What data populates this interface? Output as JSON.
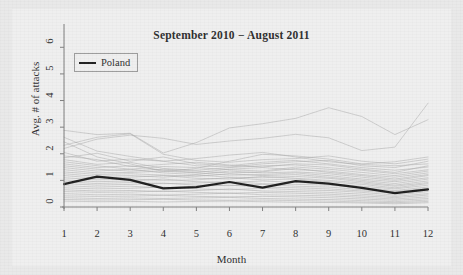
{
  "chart_data": {
    "type": "line",
    "title": "September 2010 − August 2011",
    "xlabel": "Month",
    "ylabel": "Avg. # of attacks",
    "xlim": [
      1,
      12
    ],
    "ylim": [
      0,
      6.5
    ],
    "xticks": [
      "1",
      "2",
      "3",
      "4",
      "5",
      "6",
      "7",
      "8",
      "9",
      "10",
      "11",
      "12"
    ],
    "yticks": [
      "0",
      "1",
      "2",
      "3",
      "4",
      "5",
      "6"
    ],
    "grid": false,
    "legend_position": "top-left",
    "legend": [
      {
        "name": "Poland",
        "color": "#1c1c1c",
        "width": 2.2
      }
    ],
    "x": [
      1,
      2,
      3,
      4,
      5,
      6,
      7,
      8,
      9,
      10,
      11,
      12
    ],
    "highlight_color": "#1c1c1c",
    "background_color": "#efefef",
    "other_series_color": "#a8a8a8",
    "series": [
      {
        "name": "Poland",
        "highlight": true,
        "values": [
          0.86,
          1.14,
          1.02,
          0.7,
          0.75,
          0.94,
          0.73,
          0.97,
          0.88,
          0.72,
          0.52,
          0.66
        ]
      },
      {
        "name": "other-01",
        "highlight": false,
        "values": [
          2.88,
          2.72,
          2.77,
          2.03,
          2.42,
          2.97,
          3.13,
          3.33,
          3.73,
          3.4,
          2.72,
          3.28
        ]
      },
      {
        "name": "other-02",
        "highlight": false,
        "values": [
          2.2,
          2.55,
          2.7,
          2.58,
          2.35,
          2.48,
          2.58,
          2.73,
          2.6,
          2.12,
          2.25,
          3.9
        ]
      },
      {
        "name": "other-03",
        "highlight": false,
        "values": [
          2.45,
          1.88,
          1.62,
          1.33,
          1.45,
          1.72,
          1.98,
          1.92,
          1.8,
          1.62,
          1.7,
          1.88
        ]
      },
      {
        "name": "other-04",
        "highlight": false,
        "values": [
          2.05,
          1.72,
          1.8,
          1.72,
          1.55,
          1.5,
          1.62,
          1.7,
          1.75,
          1.55,
          1.48,
          1.72
        ]
      },
      {
        "name": "other-05",
        "highlight": false,
        "values": [
          1.92,
          1.78,
          1.52,
          1.6,
          1.68,
          1.58,
          1.5,
          1.62,
          1.58,
          1.42,
          1.3,
          1.55
        ]
      },
      {
        "name": "other-06",
        "highlight": false,
        "values": [
          1.78,
          1.6,
          1.68,
          1.45,
          1.38,
          1.48,
          1.55,
          1.58,
          1.48,
          1.38,
          1.25,
          1.4
        ]
      },
      {
        "name": "other-07",
        "highlight": false,
        "values": [
          1.7,
          1.55,
          1.42,
          1.52,
          1.48,
          1.4,
          1.35,
          1.5,
          1.42,
          1.3,
          1.18,
          1.35
        ]
      },
      {
        "name": "other-08",
        "highlight": false,
        "values": [
          1.62,
          1.48,
          1.55,
          1.38,
          1.3,
          1.42,
          1.48,
          1.4,
          1.35,
          1.22,
          1.12,
          1.28
        ]
      },
      {
        "name": "other-09",
        "highlight": false,
        "values": [
          1.55,
          1.42,
          1.35,
          1.42,
          1.35,
          1.28,
          1.32,
          1.45,
          1.3,
          1.18,
          1.05,
          1.22
        ]
      },
      {
        "name": "other-10",
        "highlight": false,
        "values": [
          1.48,
          1.35,
          1.42,
          1.28,
          1.22,
          1.35,
          1.28,
          1.32,
          1.25,
          1.12,
          1.0,
          1.18
        ]
      },
      {
        "name": "other-11",
        "highlight": false,
        "values": [
          1.4,
          1.28,
          1.3,
          1.35,
          1.28,
          1.2,
          1.22,
          1.28,
          1.18,
          1.05,
          0.95,
          1.1
        ]
      },
      {
        "name": "other-12",
        "highlight": false,
        "values": [
          1.32,
          1.22,
          1.25,
          1.2,
          1.15,
          1.25,
          1.18,
          1.22,
          1.12,
          1.0,
          0.88,
          1.05
        ]
      },
      {
        "name": "other-13",
        "highlight": false,
        "values": [
          1.25,
          1.15,
          1.18,
          1.12,
          1.2,
          1.12,
          1.1,
          1.15,
          1.08,
          0.95,
          0.82,
          0.98
        ]
      },
      {
        "name": "other-14",
        "highlight": false,
        "values": [
          1.18,
          1.08,
          1.12,
          1.18,
          1.08,
          1.05,
          1.15,
          1.08,
          1.0,
          0.9,
          0.78,
          0.92
        ]
      },
      {
        "name": "other-15",
        "highlight": false,
        "values": [
          1.1,
          1.02,
          1.05,
          1.0,
          1.02,
          1.1,
          1.02,
          1.05,
          0.95,
          0.85,
          0.72,
          0.88
        ]
      },
      {
        "name": "other-16",
        "highlight": false,
        "values": [
          1.02,
          0.95,
          0.98,
          1.05,
          0.95,
          0.92,
          0.98,
          0.92,
          0.88,
          0.78,
          0.68,
          0.82
        ]
      },
      {
        "name": "other-17",
        "highlight": false,
        "values": [
          0.95,
          0.88,
          0.92,
          0.88,
          0.9,
          0.95,
          0.88,
          0.85,
          0.82,
          0.72,
          0.62,
          0.75
        ]
      },
      {
        "name": "other-18",
        "highlight": false,
        "values": [
          0.88,
          0.82,
          0.85,
          0.9,
          0.82,
          0.8,
          0.85,
          0.78,
          0.75,
          0.65,
          0.58,
          0.7
        ]
      },
      {
        "name": "other-19",
        "highlight": false,
        "values": [
          0.8,
          0.75,
          0.78,
          0.72,
          0.78,
          0.82,
          0.75,
          0.72,
          0.68,
          0.6,
          0.52,
          0.62
        ]
      },
      {
        "name": "other-20",
        "highlight": false,
        "values": [
          0.72,
          0.68,
          0.7,
          0.75,
          0.68,
          0.65,
          0.7,
          0.65,
          0.62,
          0.55,
          0.45,
          0.58
        ]
      },
      {
        "name": "other-21",
        "highlight": false,
        "values": [
          0.65,
          0.6,
          0.62,
          0.58,
          0.62,
          0.68,
          0.6,
          0.58,
          0.55,
          0.48,
          0.4,
          0.5
        ]
      },
      {
        "name": "other-22",
        "highlight": false,
        "values": [
          0.58,
          0.55,
          0.56,
          0.6,
          0.55,
          0.52,
          0.55,
          0.52,
          0.48,
          0.42,
          0.35,
          0.45
        ]
      },
      {
        "name": "other-23",
        "highlight": false,
        "values": [
          0.5,
          0.46,
          0.48,
          0.45,
          0.48,
          0.52,
          0.46,
          0.44,
          0.42,
          0.36,
          0.3,
          0.38
        ]
      },
      {
        "name": "other-24",
        "highlight": false,
        "values": [
          0.42,
          0.4,
          0.41,
          0.44,
          0.4,
          0.38,
          0.4,
          0.38,
          0.35,
          0.3,
          0.25,
          0.32
        ]
      },
      {
        "name": "other-25",
        "highlight": false,
        "values": [
          0.35,
          0.32,
          0.34,
          0.32,
          0.34,
          0.36,
          0.32,
          0.3,
          0.28,
          0.24,
          0.2,
          0.26
        ]
      },
      {
        "name": "other-26",
        "highlight": false,
        "values": [
          0.28,
          0.26,
          0.27,
          0.29,
          0.26,
          0.25,
          0.26,
          0.24,
          0.22,
          0.19,
          0.16,
          0.21
        ]
      },
      {
        "name": "other-27",
        "highlight": false,
        "values": [
          0.22,
          0.2,
          0.21,
          0.19,
          0.21,
          0.22,
          0.2,
          0.18,
          0.17,
          0.15,
          0.12,
          0.16
        ]
      },
      {
        "name": "other-28",
        "highlight": false,
        "values": [
          2.62,
          2.1,
          1.9,
          1.72,
          1.82,
          1.95,
          2.05,
          1.88,
          1.7,
          1.6,
          1.55,
          1.62
        ]
      },
      {
        "name": "other-29",
        "highlight": false,
        "values": [
          2.32,
          2.62,
          2.75,
          1.98,
          1.75,
          1.68,
          1.78,
          1.82,
          1.92,
          1.72,
          1.62,
          1.8
        ]
      },
      {
        "name": "other-30",
        "highlight": false,
        "values": [
          1.85,
          2.02,
          1.72,
          1.88,
          1.62,
          1.55,
          1.68,
          1.75,
          1.62,
          1.48,
          1.38,
          1.5
        ]
      }
    ]
  }
}
